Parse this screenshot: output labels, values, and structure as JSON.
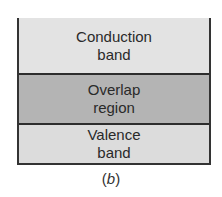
{
  "diagram": {
    "bands": [
      {
        "line1": "Conduction",
        "line2": "band",
        "color": "#e3e3e3"
      },
      {
        "line1": "Overlap",
        "line2": "region",
        "color": "#b4b4b4"
      },
      {
        "line1": "Valence",
        "line2": "band",
        "color": "#dcdcdc"
      }
    ],
    "caption_open": "(",
    "caption_letter": "b",
    "caption_close": ")"
  }
}
